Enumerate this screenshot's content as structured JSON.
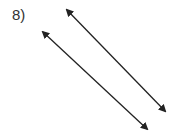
{
  "problem": {
    "label": "8)"
  },
  "diagram": {
    "stroke_color": "#222222",
    "lines": [
      {
        "name": "line-a",
        "x1": 67,
        "y1": 10,
        "x2": 165,
        "y2": 111
      },
      {
        "name": "line-b",
        "x1": 43,
        "y1": 32,
        "x2": 147,
        "y2": 129
      }
    ]
  }
}
